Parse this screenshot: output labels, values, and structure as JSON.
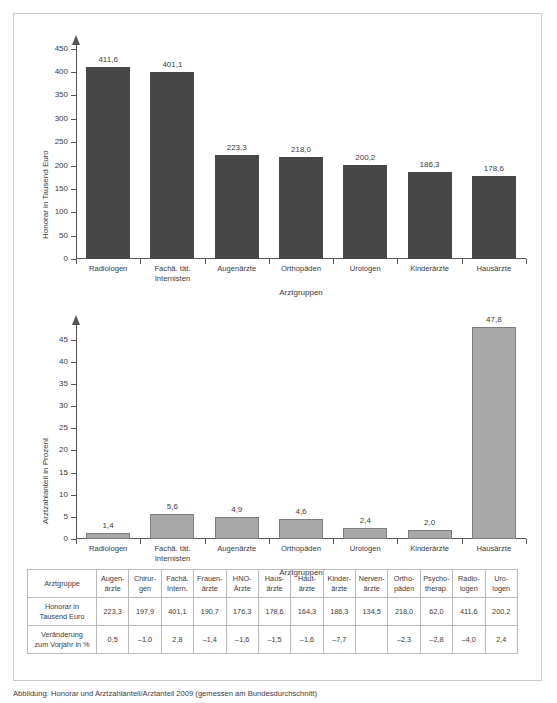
{
  "caption": "Abbildung: Honorar und Arztzahlanteil/Arztanteil 2009 (gemessen am Bundesdurchschnitt)",
  "chart_data": [
    {
      "type": "bar",
      "id": "honorar",
      "title": "",
      "xlabel": "Arztgruppen",
      "ylabel": "Honorar in Tausend Euro",
      "categories": [
        "Radiologen",
        "Fachä. tät.\nInternisten",
        "Augenärzte",
        "Orthopäden",
        "Urologen",
        "Kinderärzte",
        "Hausärzte"
      ],
      "category_lines": [
        [
          "Radiologen"
        ],
        [
          "Fachä. tät.",
          "Internisten"
        ],
        [
          "Augenärzte"
        ],
        [
          "Orthopäden"
        ],
        [
          "Urologen"
        ],
        [
          "Kinderärzte"
        ],
        [
          "Hausärzte"
        ]
      ],
      "values": [
        411.6,
        401.1,
        223.3,
        218.0,
        200.2,
        186.3,
        178.6
      ],
      "value_labels": [
        "411,6",
        "401,1",
        "223,3",
        "218,0",
        "200,2",
        "186,3",
        "178,6"
      ],
      "ylim": [
        0,
        460
      ],
      "yticks": [
        0,
        50,
        100,
        150,
        200,
        250,
        300,
        350,
        400,
        450
      ],
      "ytick_labels": [
        "0",
        "50",
        "100",
        "150",
        "200",
        "250",
        "300",
        "350",
        "400",
        "450"
      ],
      "grid": false,
      "bar_color": "#474747"
    },
    {
      "type": "bar",
      "id": "arztzahlanteil",
      "title": "",
      "xlabel": "Arztgruppen",
      "ylabel": "Arztzahlanteil in Prozent",
      "categories": [
        "Radiologen",
        "Fachä. tät.\nInternisten",
        "Augenärzte",
        "Orthopäden",
        "Urologen",
        "Kinderärzte",
        "Hausärzte"
      ],
      "category_lines": [
        [
          "Radiologen"
        ],
        [
          "Fachä. tät.",
          "Internisten"
        ],
        [
          "Augenärzte"
        ],
        [
          "Orthopäden"
        ],
        [
          "Urologen"
        ],
        [
          "Kinderärzte"
        ],
        [
          "Hausärzte"
        ]
      ],
      "values": [
        1.4,
        5.6,
        4.9,
        4.6,
        2.4,
        2.0,
        47.8
      ],
      "value_labels": [
        "1,4",
        "5,6",
        "4,9",
        "4,6",
        "2,4",
        "2,0",
        "47,8"
      ],
      "ylim": [
        0,
        48.5
      ],
      "yticks": [
        0,
        5,
        10,
        15,
        20,
        25,
        30,
        35,
        40,
        45
      ],
      "ytick_labels": [
        "0",
        "5",
        "10",
        "15",
        "20",
        "25",
        "30",
        "35",
        "40",
        "45"
      ],
      "grid": false,
      "bar_color": "#a8a8a8"
    },
    {
      "type": "table",
      "id": "detail-table",
      "row_header_label": "Arztgruppe",
      "columns": [
        [
          "Augen-",
          "ärzte"
        ],
        [
          "Chirur-",
          "gen"
        ],
        [
          "Fachä.",
          "Intern."
        ],
        [
          "Frauen-",
          "ärzte"
        ],
        [
          "HNO-",
          "Ärzte"
        ],
        [
          "Haus-",
          "ärzte"
        ],
        [
          "Haut-",
          "ärzte"
        ],
        [
          "Kinder-",
          "ärzte"
        ],
        [
          "Nerven-",
          "ärzte"
        ],
        [
          "Ortho-",
          "päden"
        ],
        [
          "Psycho-",
          "therap."
        ],
        [
          "Radio-",
          "logen"
        ],
        [
          "Uro-",
          "logen"
        ]
      ],
      "rows": [
        {
          "label_lines": [
            "Honorar in",
            "Tausend Euro"
          ],
          "values": [
            "223,3",
            "197,9",
            "401,1",
            "190,7",
            "176,3",
            "178,6",
            "164,3",
            "186,3",
            "134,5",
            "218,0",
            "62,0",
            "411,6",
            "200,2"
          ]
        },
        {
          "label_lines": [
            "Veränderung",
            "zum Vorjahr in %"
          ],
          "values": [
            "0,5",
            "–1,0",
            "2,8",
            "–1,4",
            "–1,6",
            "–1,5",
            "–1,6",
            "–7,7",
            "",
            "–2,3",
            "–2,8",
            "–4,0",
            "2,4"
          ]
        }
      ]
    }
  ]
}
